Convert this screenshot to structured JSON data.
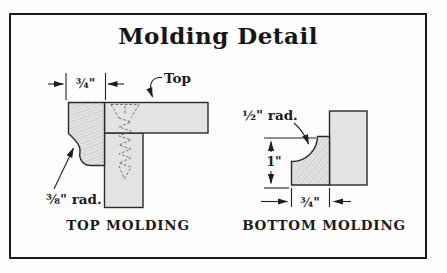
{
  "title": "Molding Detail",
  "left_diagram": {
    "caption": "TOP MOLDING",
    "top_label": "Top",
    "radius_label": "⅜\" rad.",
    "width_dim": "¾\""
  },
  "right_diagram": {
    "caption": "BOTTOM MOLDING",
    "radius_label": "½\" rad.",
    "height_dim": "1\"",
    "width_dim": "¾\""
  },
  "colors": {
    "line_color": "#1b1b1b",
    "board_fill": "#e3e3e3",
    "border_color": "#181818",
    "paper": "#fdfdfd"
  }
}
